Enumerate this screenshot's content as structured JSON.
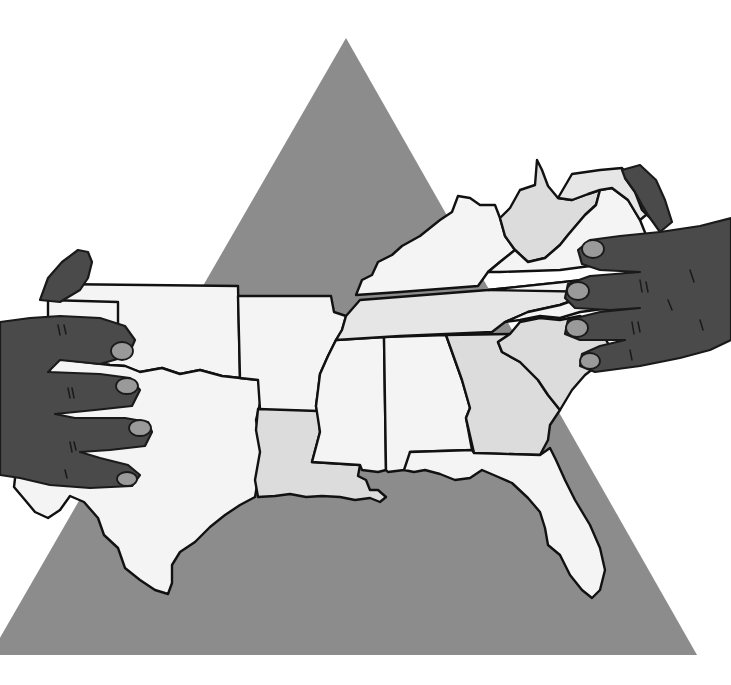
{
  "illustration": {
    "subject": "Two hands stretching a map of the southern United States over a gray triangle",
    "colors": {
      "background": "#ffffff",
      "triangle": "#8c8c8c",
      "state_light": "#f4f4f4",
      "state_mid": "#dcdcdc",
      "hand": "#4a4a4a",
      "nail": "#9a9a9a",
      "outline": "#111111"
    },
    "states": [
      {
        "name": "Oklahoma"
      },
      {
        "name": "Texas"
      },
      {
        "name": "Arkansas"
      },
      {
        "name": "Louisiana"
      },
      {
        "name": "Mississippi"
      },
      {
        "name": "Alabama"
      },
      {
        "name": "Georgia"
      },
      {
        "name": "Florida"
      },
      {
        "name": "Tennessee"
      },
      {
        "name": "Kentucky"
      },
      {
        "name": "South Carolina"
      },
      {
        "name": "North Carolina"
      },
      {
        "name": "Virginia"
      },
      {
        "name": "West Virginia"
      },
      {
        "name": "Maryland"
      },
      {
        "name": "Delaware"
      }
    ],
    "hands": [
      {
        "side": "left"
      },
      {
        "side": "right"
      }
    ]
  }
}
